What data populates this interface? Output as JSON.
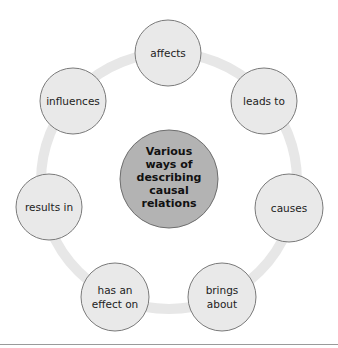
{
  "diagram": {
    "center": {
      "lines": [
        "Various",
        "ways of",
        "describing",
        "causal",
        "relations"
      ],
      "fill": "#b3b3b3",
      "stroke": "#6e6e6e"
    },
    "ring": {
      "color": "#e7e7e7"
    },
    "node_style": {
      "fill": "#e9e9e9",
      "stroke": "#7a7a7a"
    },
    "nodes": [
      {
        "lines": [
          "affects"
        ]
      },
      {
        "lines": [
          "leads to"
        ]
      },
      {
        "lines": [
          "causes"
        ]
      },
      {
        "lines": [
          "brings",
          "about"
        ]
      },
      {
        "lines": [
          "has an",
          "effect on"
        ]
      },
      {
        "lines": [
          "results in"
        ]
      },
      {
        "lines": [
          "influences"
        ]
      }
    ]
  }
}
